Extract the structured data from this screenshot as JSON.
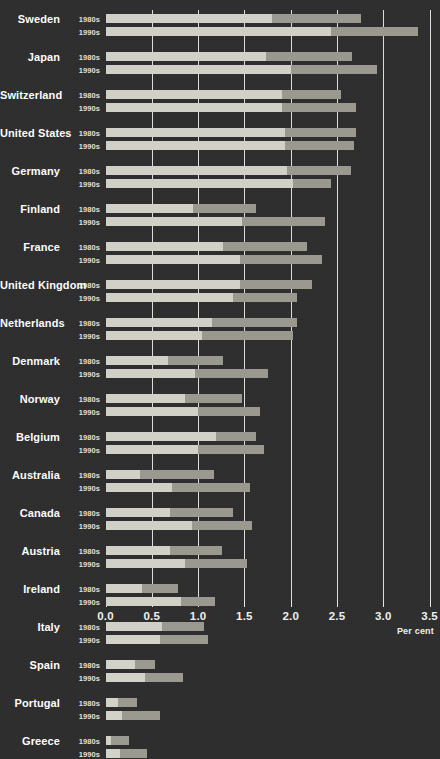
{
  "chart": {
    "type": "bar",
    "title": "",
    "xlabel": "Per cent",
    "ylabel": "",
    "axis_unit_label": "Per cent",
    "orientation": "horizontal",
    "stacked": true,
    "grid": true,
    "legend_position": "none",
    "xlim": [
      0.0,
      3.5
    ],
    "xticks": [
      "0.0",
      "0.5",
      "1.0",
      "1.5",
      "2.0",
      "2.5",
      "3.0",
      "3.5"
    ],
    "xtick_values": [
      0.0,
      0.5,
      1.0,
      1.5,
      2.0,
      2.5,
      3.0,
      3.5
    ],
    "series_names": [
      "segment-1",
      "segment-2"
    ],
    "decades": [
      "1980s",
      "1990s"
    ],
    "colors": {
      "background": "#2e2e2e",
      "segment_1": "#d2d2c8",
      "segment_2": "#9a9a90",
      "gridline": "#f0f0ea",
      "text": "#ffffff"
    }
  },
  "chart_data": {
    "type": "bar",
    "title": "",
    "xlabel": "Per cent",
    "ylabel": "",
    "xlim": [
      0.0,
      3.5
    ],
    "grid": true,
    "legend_position": "none",
    "stacked": true,
    "orientation": "horizontal",
    "categories": [
      "Sweden",
      "Japan",
      "Switzerland",
      "United States",
      "Germany",
      "Finland",
      "France",
      "United Kingdom",
      "Netherlands",
      "Denmark",
      "Norway",
      "Belgium",
      "Australia",
      "Canada",
      "Austria",
      "Ireland",
      "Italy",
      "Spain",
      "Portugal",
      "Greece"
    ],
    "subcategories": [
      "1980s",
      "1990s"
    ],
    "series": [
      {
        "name": "segment-1",
        "color": "#d2d2c8"
      },
      {
        "name": "segment-2",
        "color": "#9a9a90"
      }
    ],
    "rows": [
      {
        "country": "Sweden",
        "decade": "1980s",
        "seg1": 1.8,
        "seg2": 0.96,
        "total": 2.76
      },
      {
        "country": "Sweden",
        "decade": "1990s",
        "seg1": 2.43,
        "seg2": 0.94,
        "total": 3.37
      },
      {
        "country": "Japan",
        "decade": "1980s",
        "seg1": 1.73,
        "seg2": 0.93,
        "total": 2.66
      },
      {
        "country": "Japan",
        "decade": "1990s",
        "seg1": 2.0,
        "seg2": 0.93,
        "total": 2.93
      },
      {
        "country": "Switzerland",
        "decade": "1980s",
        "seg1": 1.91,
        "seg2": 0.63,
        "total": 2.54
      },
      {
        "country": "Switzerland",
        "decade": "1990s",
        "seg1": 1.91,
        "seg2": 0.8,
        "total": 2.71
      },
      {
        "country": "United States",
        "decade": "1980s",
        "seg1": 1.94,
        "seg2": 0.77,
        "total": 2.71
      },
      {
        "country": "United States",
        "decade": "1990s",
        "seg1": 1.94,
        "seg2": 0.74,
        "total": 2.68
      },
      {
        "country": "Germany",
        "decade": "1980s",
        "seg1": 1.96,
        "seg2": 0.69,
        "total": 2.65
      },
      {
        "country": "Germany",
        "decade": "1990s",
        "seg1": 2.03,
        "seg2": 0.4,
        "total": 2.43
      },
      {
        "country": "Finland",
        "decade": "1980s",
        "seg1": 0.95,
        "seg2": 0.68,
        "total": 1.63
      },
      {
        "country": "Finland",
        "decade": "1990s",
        "seg1": 1.47,
        "seg2": 0.9,
        "total": 2.37
      },
      {
        "country": "France",
        "decade": "1980s",
        "seg1": 1.27,
        "seg2": 0.91,
        "total": 2.18
      },
      {
        "country": "France",
        "decade": "1990s",
        "seg1": 1.45,
        "seg2": 0.89,
        "total": 2.34
      },
      {
        "country": "United Kingdom",
        "decade": "1980s",
        "seg1": 1.45,
        "seg2": 0.78,
        "total": 2.23
      },
      {
        "country": "United Kingdom",
        "decade": "1990s",
        "seg1": 1.38,
        "seg2": 0.69,
        "total": 2.07
      },
      {
        "country": "Netherlands",
        "decade": "1980s",
        "seg1": 1.15,
        "seg2": 0.92,
        "total": 2.07
      },
      {
        "country": "Netherlands",
        "decade": "1990s",
        "seg1": 1.04,
        "seg2": 0.99,
        "total": 2.03
      },
      {
        "country": "Denmark",
        "decade": "1980s",
        "seg1": 0.68,
        "seg2": 0.59,
        "total": 1.27
      },
      {
        "country": "Denmark",
        "decade": "1990s",
        "seg1": 0.97,
        "seg2": 0.79,
        "total": 1.76
      },
      {
        "country": "Norway",
        "decade": "1980s",
        "seg1": 0.86,
        "seg2": 0.61,
        "total": 1.47
      },
      {
        "country": "Norway",
        "decade": "1990s",
        "seg1": 1.0,
        "seg2": 0.67,
        "total": 1.67
      },
      {
        "country": "Belgium",
        "decade": "1980s",
        "seg1": 1.19,
        "seg2": 0.43,
        "total": 1.62
      },
      {
        "country": "Belgium",
        "decade": "1990s",
        "seg1": 1.0,
        "seg2": 0.71,
        "total": 1.71
      },
      {
        "country": "Australia",
        "decade": "1980s",
        "seg1": 0.37,
        "seg2": 0.8,
        "total": 1.17
      },
      {
        "country": "Australia",
        "decade": "1990s",
        "seg1": 0.72,
        "seg2": 0.84,
        "total": 1.56
      },
      {
        "country": "Canada",
        "decade": "1980s",
        "seg1": 0.7,
        "seg2": 0.68,
        "total": 1.38
      },
      {
        "country": "Canada",
        "decade": "1990s",
        "seg1": 0.93,
        "seg2": 0.65,
        "total": 1.58
      },
      {
        "country": "Austria",
        "decade": "1980s",
        "seg1": 0.7,
        "seg2": 0.56,
        "total": 1.26
      },
      {
        "country": "Austria",
        "decade": "1990s",
        "seg1": 0.86,
        "seg2": 0.67,
        "total": 1.53
      },
      {
        "country": "Ireland",
        "decade": "1980s",
        "seg1": 0.39,
        "seg2": 0.39,
        "total": 0.78
      },
      {
        "country": "Ireland",
        "decade": "1990s",
        "seg1": 0.82,
        "seg2": 0.36,
        "total": 1.18
      },
      {
        "country": "Italy",
        "decade": "1980s",
        "seg1": 0.61,
        "seg2": 0.45,
        "total": 1.06
      },
      {
        "country": "Italy",
        "decade": "1990s",
        "seg1": 0.59,
        "seg2": 0.52,
        "total": 1.11
      },
      {
        "country": "Spain",
        "decade": "1980s",
        "seg1": 0.32,
        "seg2": 0.22,
        "total": 0.54
      },
      {
        "country": "Spain",
        "decade": "1990s",
        "seg1": 0.43,
        "seg2": 0.41,
        "total": 0.84
      },
      {
        "country": "Portugal",
        "decade": "1980s",
        "seg1": 0.13,
        "seg2": 0.21,
        "total": 0.34
      },
      {
        "country": "Portugal",
        "decade": "1990s",
        "seg1": 0.18,
        "seg2": 0.41,
        "total": 0.59
      },
      {
        "country": "Greece",
        "decade": "1980s",
        "seg1": 0.06,
        "seg2": 0.19,
        "total": 0.25
      },
      {
        "country": "Greece",
        "decade": "1990s",
        "seg1": 0.16,
        "seg2": 0.29,
        "total": 0.45
      }
    ]
  }
}
